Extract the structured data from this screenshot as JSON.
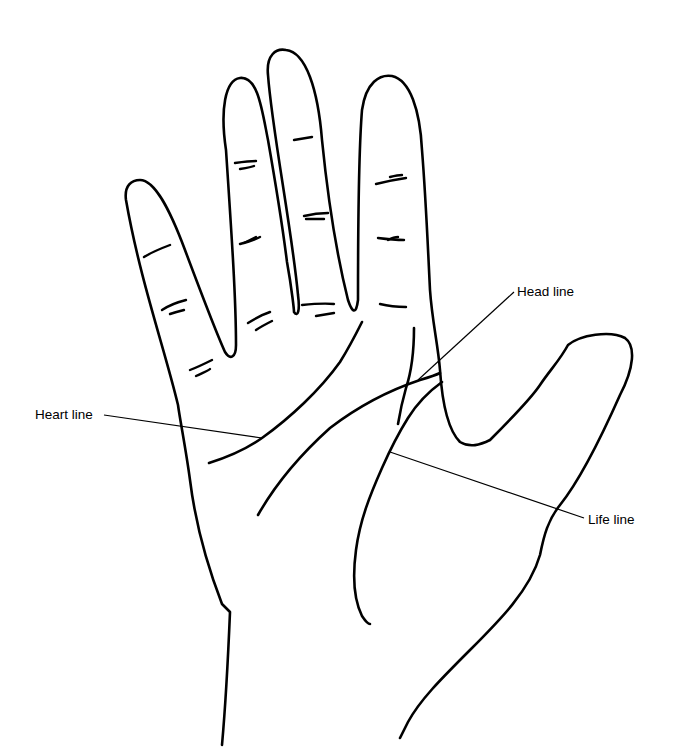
{
  "diagram": {
    "type": "palmistry hand line drawing",
    "labels": {
      "head_line": "Head line",
      "heart_line": "Heart line",
      "life_line": "Life line"
    },
    "colors": {
      "background": "#ffffff",
      "stroke": "#000000"
    }
  }
}
